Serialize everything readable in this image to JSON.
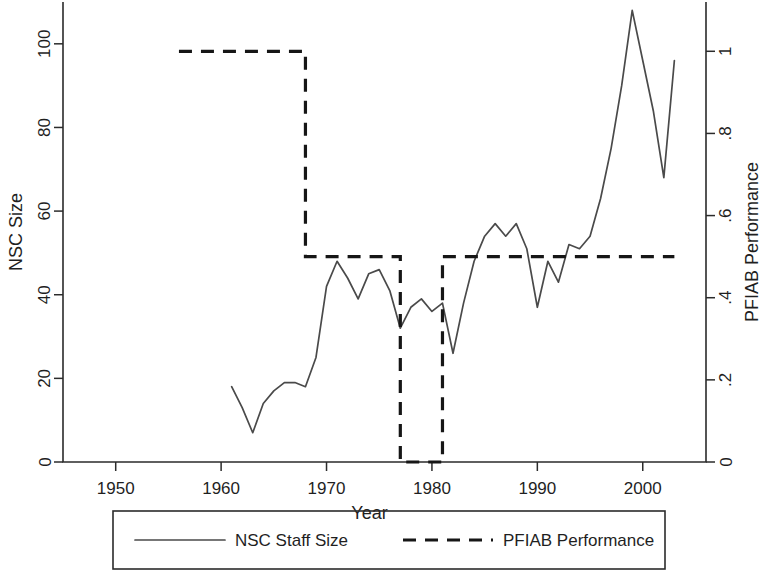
{
  "chart_data": {
    "type": "line",
    "title": "",
    "xlabel": "Year",
    "ylabel": "NSC Size",
    "y2label": "PFIAB Performance",
    "xlim": [
      1945,
      2006
    ],
    "ylim": [
      0,
      110
    ],
    "y2lim": [
      0,
      1.12
    ],
    "grid": false,
    "xticks": [
      1950,
      1960,
      1970,
      1980,
      1990,
      2000
    ],
    "xticklabels": [
      "1950",
      "1960",
      "1970",
      "1980",
      "1990",
      "2000"
    ],
    "yticks": [
      0,
      20,
      40,
      60,
      80,
      100
    ],
    "yticklabels": [
      "0",
      "20",
      "40",
      "60",
      "80",
      "100"
    ],
    "y2ticks": [
      0,
      0.2,
      0.4,
      0.6,
      0.8,
      1
    ],
    "y2ticklabels": [
      "0",
      ".2",
      ".4",
      ".6",
      ".8",
      "1"
    ],
    "legend_position": "below-center",
    "series": [
      {
        "name": "NSC Staff Size",
        "style": "solid",
        "axis": "left",
        "x": [
          1961,
          1962,
          1963,
          1964,
          1965,
          1966,
          1967,
          1968,
          1969,
          1970,
          1971,
          1972,
          1973,
          1974,
          1975,
          1976,
          1977,
          1978,
          1979,
          1980,
          1981,
          1982,
          1983,
          1984,
          1985,
          1986,
          1987,
          1988,
          1989,
          1990,
          1991,
          1992,
          1993,
          1994,
          1995,
          1996,
          1997,
          1998,
          1999,
          2000,
          2001,
          2002,
          2003
        ],
        "y": [
          18,
          13,
          7,
          14,
          17,
          19,
          19,
          18,
          25,
          42,
          48,
          44,
          39,
          45,
          46,
          41,
          32,
          37,
          39,
          36,
          38,
          26,
          38,
          48,
          54,
          57,
          54,
          57,
          51,
          37,
          48,
          43,
          52,
          51,
          54,
          63,
          75,
          90,
          108,
          96,
          84,
          68,
          96
        ]
      },
      {
        "name": "PFIAB Performance",
        "style": "dashed",
        "axis": "right",
        "x": [
          1956,
          1967,
          1968,
          1976,
          1977,
          1980,
          1981,
          1995,
          1996,
          2003
        ],
        "y": [
          1,
          1,
          0.5,
          0.5,
          0,
          0,
          0.5,
          0.5,
          0.5,
          0.5
        ],
        "step": true
      }
    ]
  },
  "legend": {
    "entries": [
      {
        "label": "NSC Staff Size",
        "style": "solid"
      },
      {
        "label": "PFIAB Performance",
        "style": "dashed"
      }
    ]
  }
}
